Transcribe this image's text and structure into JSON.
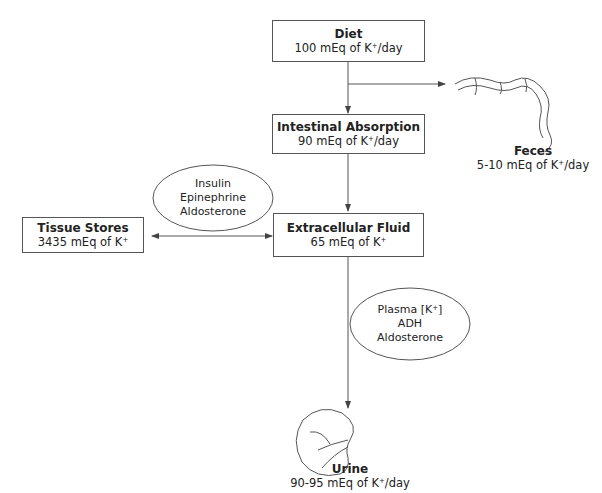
{
  "diagram": {
    "nodes": {
      "diet": {
        "title": "Diet",
        "value": "100 mEq of K",
        "unit": "/day"
      },
      "intestinal": {
        "title": "Intestinal Absorption",
        "value": "90 mEq of K",
        "unit": "/day"
      },
      "ecf": {
        "title": "Extracellular Fluid",
        "value": "65 mEq of K",
        "unit": ""
      },
      "tissue": {
        "title": "Tissue Stores",
        "value": "3435 mEq of K",
        "unit": ""
      },
      "feces": {
        "title": "Feces",
        "value": "5-10 mEq of K",
        "unit": "/day"
      },
      "urine": {
        "title": "Urine",
        "value": "90-95 mEq of K",
        "unit": "/day"
      }
    },
    "superscript": "+",
    "regulators": {
      "tissue": [
        "Insulin",
        "Epinephrine",
        "Aldosterone"
      ],
      "renal": {
        "line1_prefix": "Plasma [K",
        "line1_suffix": "]",
        "line2": "ADH",
        "line3": "Aldosterone"
      }
    },
    "icons": [
      "intestine-icon",
      "kidney-icon"
    ],
    "colors": {
      "line": "#555555",
      "text": "#222222",
      "background": "#ffffff"
    }
  }
}
